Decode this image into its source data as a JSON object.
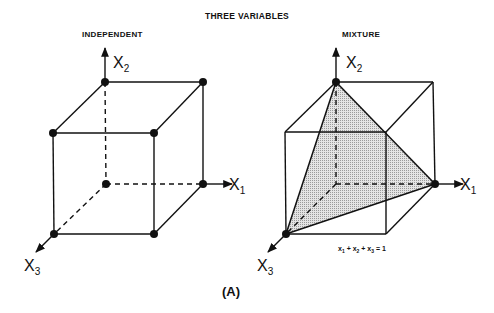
{
  "figure": {
    "title": "THREE VARIABLES",
    "caption": "(A)"
  },
  "panels": [
    {
      "id": "independent",
      "title": "INDEPENDENT",
      "axes": {
        "x1": {
          "label": "X",
          "subscript": "1"
        },
        "x2": {
          "label": "X",
          "subscript": "2"
        },
        "x3": {
          "label": "X",
          "subscript": "3"
        }
      },
      "description": "Cube with design points at all 8 vertices"
    },
    {
      "id": "mixture",
      "title": "MIXTURE",
      "axes": {
        "x1": {
          "label": "X",
          "subscript": "1"
        },
        "x2": {
          "label": "X",
          "subscript": "2"
        },
        "x3": {
          "label": "X",
          "subscript": "3"
        }
      },
      "constraint": {
        "parts": [
          "x",
          "1",
          " + x",
          "2",
          " + x",
          "3",
          " = 1"
        ],
        "text": "x1 + x2 + x3 = 1"
      },
      "description": "Cube with shaded simplex triangle; points at 3 vertices"
    }
  ],
  "colors": {
    "line": "#111111",
    "shade": "#c8c8c8"
  }
}
